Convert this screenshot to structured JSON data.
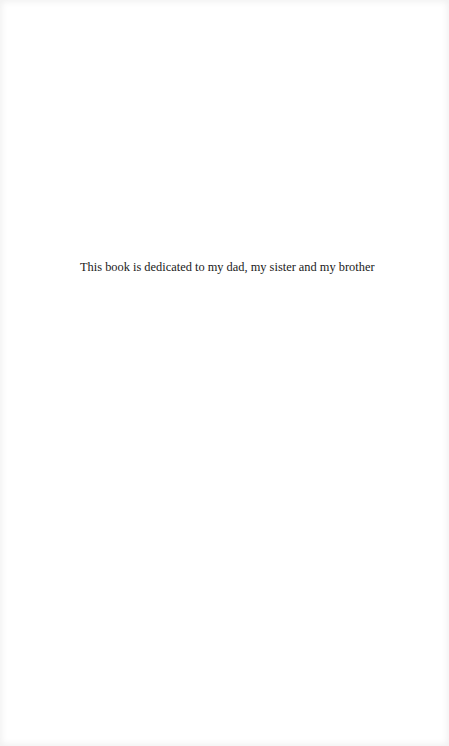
{
  "page": {
    "type": "dedication",
    "dedication_text": "This book is dedicated to my dad, my sister and my brother"
  },
  "colors": {
    "background": "#ffffff",
    "text": "#1a1a1a"
  }
}
